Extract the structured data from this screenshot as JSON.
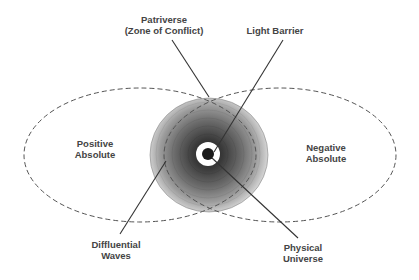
{
  "diagram": {
    "type": "concentric-zones",
    "colors": {
      "background": "#ffffff",
      "text": "#444444",
      "lines": "#333333",
      "ellipse_dash": "#555555",
      "sphere_outer": "#d4d4d4",
      "sphere_inner": "#303030",
      "light_barrier_ring": "#ffffff",
      "core": "#1a1a1a"
    },
    "regions": {
      "left_ellipse": {
        "label_line1": "Positive",
        "label_line2": "Absolute"
      },
      "right_ellipse": {
        "label_line1": "Negative",
        "label_line2": "Absolute"
      }
    },
    "callouts": {
      "patriverse": {
        "line1": "Patriverse",
        "line2": "(Zone of Conflict)"
      },
      "light_barrier": {
        "line1": "Light Barrier"
      },
      "diffluential_waves": {
        "line1": "Diffluential",
        "line2": "Waves"
      },
      "physical_universe": {
        "line1": "Physical",
        "line2": "Universe"
      }
    }
  }
}
